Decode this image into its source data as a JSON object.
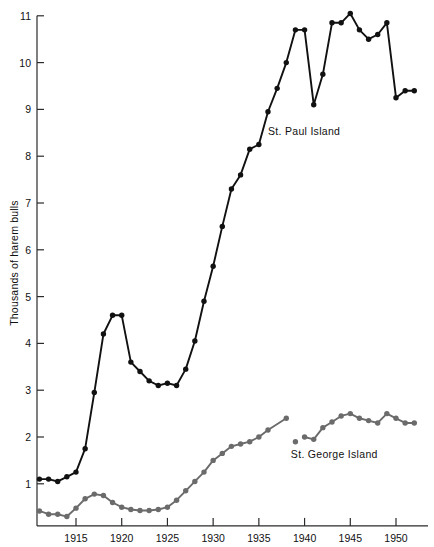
{
  "chart_data": {
    "type": "line",
    "title": "",
    "subtitle": "",
    "xlabel": "",
    "ylabel": "Thousands of harem bulls",
    "xlim": [
      1911,
      1952.5
    ],
    "ylim": [
      0.1,
      11
    ],
    "grid": false,
    "legend_position": "inline-annotations",
    "xticks": [
      1915,
      1920,
      1925,
      1930,
      1935,
      1940,
      1945,
      1950
    ],
    "xticklabels": [
      "1915",
      "1920",
      "1925",
      "1930",
      "1935",
      "1940",
      "1945",
      "1950"
    ],
    "yticks": [
      1,
      2,
      3,
      4,
      5,
      6,
      7,
      8,
      9,
      10,
      11
    ],
    "yticklabels": [
      "1",
      "2",
      "3",
      "4",
      "5",
      "6",
      "7",
      "8",
      "9",
      "10",
      "11"
    ],
    "series": [
      {
        "name": "St. Paul Island",
        "color": "#111111",
        "marker": "circle",
        "label_x": 1936.0,
        "label_y": 8.45,
        "x": [
          1911,
          1912,
          1913,
          1914,
          1915,
          1916,
          1917,
          1918,
          1919,
          1920,
          1921,
          1922,
          1923,
          1924,
          1925,
          1926,
          1927,
          1928,
          1929,
          1930,
          1931,
          1932,
          1933,
          1934,
          1935,
          1936,
          1937,
          1938,
          1939,
          1940,
          1941,
          1942,
          1943,
          1944,
          1945,
          1946,
          1947,
          1948,
          1949,
          1950,
          1951,
          1952
        ],
        "y": [
          1.1,
          1.1,
          1.05,
          1.15,
          1.25,
          1.75,
          2.95,
          4.2,
          4.6,
          4.6,
          3.6,
          3.4,
          3.2,
          3.1,
          3.15,
          3.1,
          3.45,
          4.05,
          4.9,
          5.65,
          6.5,
          7.3,
          7.6,
          8.15,
          8.25,
          8.95,
          9.45,
          10.0,
          10.7,
          10.7,
          9.1,
          9.75,
          10.85,
          10.85,
          11.05,
          10.7,
          10.5,
          10.6,
          10.85,
          9.25,
          9.4,
          9.4
        ]
      },
      {
        "name": "St. George Island",
        "color": "#6b6b6b",
        "marker": "circle",
        "label_x": 1938.5,
        "label_y": 1.55,
        "x": [
          1911,
          1912,
          1913,
          1914,
          1915,
          1916,
          1917,
          1918,
          1919,
          1920,
          1921,
          1922,
          1923,
          1924,
          1925,
          1926,
          1927,
          1928,
          1929,
          1930,
          1931,
          1932,
          1933,
          1934,
          1935,
          1936,
          1938,
          1939,
          1940,
          1941,
          1942,
          1943,
          1944,
          1945,
          1946,
          1947,
          1948,
          1949,
          1950,
          1951,
          1952
        ],
        "y": [
          0.42,
          0.35,
          0.35,
          0.3,
          0.48,
          0.68,
          0.78,
          0.75,
          0.6,
          0.5,
          0.45,
          0.43,
          0.43,
          0.45,
          0.5,
          0.65,
          0.85,
          1.05,
          1.25,
          1.5,
          1.65,
          1.8,
          1.85,
          1.9,
          2.0,
          2.15,
          2.4,
          1.9,
          2.0,
          1.95,
          2.2,
          2.32,
          2.45,
          2.5,
          2.4,
          2.35,
          2.3,
          2.5,
          2.4,
          2.3,
          2.3
        ],
        "breaks": [
          26,
          27
        ]
      }
    ],
    "annotations": [
      {
        "text": "St. Paul Island",
        "x": 1936.0,
        "y": 8.45
      },
      {
        "text": "St. George Island",
        "x": 1938.5,
        "y": 1.55
      }
    ]
  },
  "axis": {
    "y_axis_title": "Thousands of harem bulls"
  }
}
